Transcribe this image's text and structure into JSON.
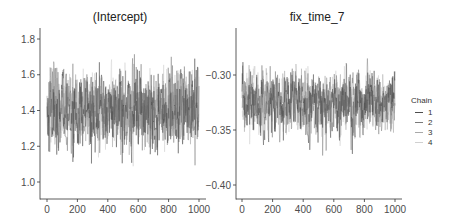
{
  "chart_data": [
    {
      "type": "line",
      "title": "(Intercept)",
      "xlabel": "",
      "ylabel": "",
      "xlim": [
        0,
        1000
      ],
      "ylim": [
        0.92,
        1.84
      ],
      "x_ticks": [
        0,
        200,
        400,
        600,
        800,
        1000
      ],
      "y_ticks": [
        1.0,
        1.2,
        1.4,
        1.6,
        1.8
      ],
      "y_tick_labels": [
        "1.0",
        "1.2",
        "1.4",
        "1.6",
        "1.8"
      ],
      "grid": false,
      "legend_position": "right",
      "series": [
        {
          "name": "1",
          "n_iter": 1000,
          "mean": 1.4,
          "sd": 0.11,
          "min": 1.03,
          "max": 1.8
        },
        {
          "name": "2",
          "n_iter": 1000,
          "mean": 1.4,
          "sd": 0.11,
          "min": 1.0,
          "max": 1.75
        },
        {
          "name": "3",
          "n_iter": 1000,
          "mean": 1.41,
          "sd": 0.1,
          "min": 1.05,
          "max": 1.72
        },
        {
          "name": "4",
          "n_iter": 1000,
          "mean": 1.4,
          "sd": 0.1,
          "min": 0.95,
          "max": 1.73
        }
      ]
    },
    {
      "type": "line",
      "title": "fix_time_7",
      "xlabel": "",
      "ylabel": "",
      "xlim": [
        0,
        1000
      ],
      "ylim": [
        -0.411,
        -0.278
      ],
      "x_ticks": [
        0,
        200,
        400,
        600,
        800,
        1000
      ],
      "y_ticks": [
        -0.3,
        -0.35,
        -0.4
      ],
      "y_tick_labels": [
        "−0.30",
        "−0.35",
        "−0.40"
      ],
      "grid": false,
      "legend_position": "right",
      "series": [
        {
          "name": "1",
          "n_iter": 1000,
          "mean": -0.325,
          "sd": 0.014,
          "min": -0.385,
          "max": -0.284
        },
        {
          "name": "2",
          "n_iter": 1000,
          "mean": -0.325,
          "sd": 0.014,
          "min": -0.408,
          "max": -0.285
        },
        {
          "name": "3",
          "n_iter": 1000,
          "mean": -0.324,
          "sd": 0.013,
          "min": -0.39,
          "max": -0.29
        },
        {
          "name": "4",
          "n_iter": 1000,
          "mean": -0.325,
          "sd": 0.013,
          "min": -0.385,
          "max": -0.292
        }
      ]
    }
  ],
  "panels": [
    {
      "title": "(Intercept)"
    },
    {
      "title": "fix_time_7"
    }
  ],
  "legend": {
    "title": "Chain",
    "items": [
      {
        "label": "1",
        "color": "#4d4d4d"
      },
      {
        "label": "2",
        "color": "#7a7a7a"
      },
      {
        "label": "3",
        "color": "#a8a8a8"
      },
      {
        "label": "4",
        "color": "#d0d0d0"
      }
    ]
  },
  "colors": {
    "axis": "#333333",
    "tick_label": "#4d4d4d",
    "background": "#ffffff"
  }
}
